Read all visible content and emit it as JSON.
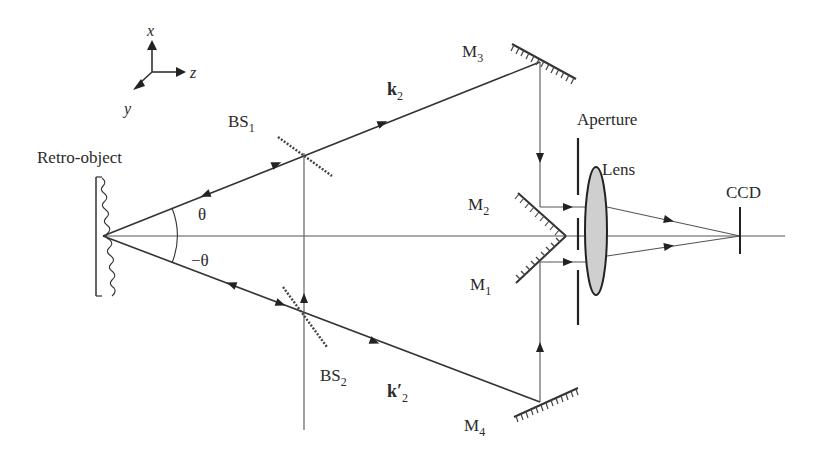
{
  "figure": {
    "axes_triad": {
      "x_label": "x",
      "y_label": "y",
      "z_label": "z"
    },
    "labels": {
      "retro_object": "Retro-object",
      "bs1": "BS",
      "bs1_sub": "1",
      "bs2": "BS",
      "bs2_sub": "2",
      "m1": "M",
      "m1_sub": "1",
      "m2": "M",
      "m2_sub": "2",
      "m3": "M",
      "m3_sub": "3",
      "m4": "M",
      "m4_sub": "4",
      "k2": "k",
      "k2_sub": "2",
      "k2prime": "k′",
      "k2prime_sub": "2",
      "theta": "θ",
      "neg_theta": "−θ",
      "aperture": "Aperture",
      "lens": "Lens",
      "ccd": "CCD"
    },
    "colors": {
      "line": "#333333",
      "lens_fill": "#cfcfcf",
      "text": "#2a2a2a"
    }
  }
}
